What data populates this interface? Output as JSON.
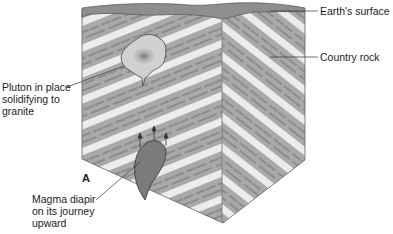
{
  "figure": {
    "panel_letter": "A",
    "labels": {
      "earth_surface": "Earth's surface",
      "country_rock": "Country rock",
      "pluton": "Pluton in place\nsolidifying to\ngranite",
      "diapir": "Magma diapir\non its journey\nupward"
    }
  },
  "colors": {
    "rock_gray": "#a9a9a9",
    "rock_light": "#ececec",
    "surface": "#8e8e8e",
    "pluton": "#cfcfcf",
    "diapir": "#7b7b7b",
    "line": "#444444"
  }
}
